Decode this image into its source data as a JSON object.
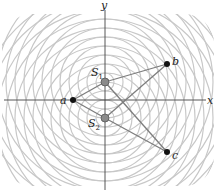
{
  "diagram": {
    "axes": {
      "x_label": "x",
      "y_label": "y",
      "origin": [
        105,
        100
      ]
    },
    "sources": [
      {
        "id": "S1",
        "label": "S",
        "sub": "1",
        "pos": [
          105,
          82
        ],
        "color": "#8a8a8a"
      },
      {
        "id": "S2",
        "label": "S",
        "sub": "2",
        "pos": [
          105,
          118
        ],
        "color": "#8a8a8a"
      }
    ],
    "points": [
      {
        "id": "a",
        "label": "a",
        "pos": [
          73,
          100
        ]
      },
      {
        "id": "b",
        "label": "b",
        "pos": [
          167,
          64
        ]
      },
      {
        "id": "c",
        "label": "c",
        "pos": [
          167,
          152
        ]
      }
    ],
    "wavefronts": {
      "ring_spacing": 9,
      "ring_count": 16,
      "color": "#c8c8c8"
    },
    "path_color": "#7d7d7d"
  }
}
